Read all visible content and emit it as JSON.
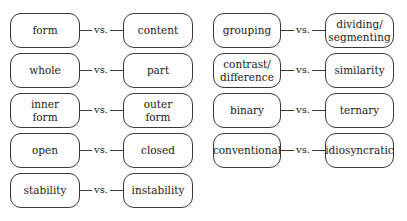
{
  "diagram": {
    "connector_label": "vs.",
    "colors": {
      "stroke": "#3a3a3a",
      "text": "#222222",
      "background": "#ffffff"
    },
    "left_column": [
      {
        "left": "form",
        "right": "content"
      },
      {
        "left": "whole",
        "right": "part"
      },
      {
        "left": "inner\nform",
        "right": "outer\nform"
      },
      {
        "left": "open",
        "right": "closed"
      },
      {
        "left": "stability",
        "right": "instability"
      }
    ],
    "right_column": [
      {
        "left": "grouping",
        "right": "dividing/\nsegmenting"
      },
      {
        "left": "contrast/\ndifference",
        "right": "similarity"
      },
      {
        "left": "binary",
        "right": "ternary"
      },
      {
        "left": "conventional",
        "right": "idiosyncratic"
      }
    ]
  }
}
